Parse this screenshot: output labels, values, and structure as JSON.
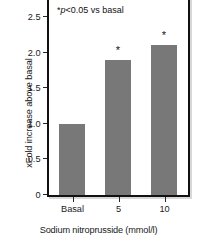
{
  "chart_data": {
    "type": "bar",
    "title": "",
    "categories": [
      "Basal",
      "5",
      "10"
    ],
    "values": [
      1.0,
      1.9,
      2.1
    ],
    "significance_markers": [
      "",
      "*",
      "*"
    ],
    "xlabel": "Sodium nitroprusside (mmol/l)",
    "ylabel": "xFold increase above basal",
    "ylim": [
      0,
      2.75
    ],
    "yticks": [
      "0",
      "0.5",
      "1.0",
      "1.5",
      "2.0",
      "2.5"
    ],
    "ytick_values": [
      0,
      0.5,
      1.0,
      1.5,
      2.0,
      2.5
    ],
    "annotation_prefix": "*",
    "annotation_italic": "p",
    "annotation_rest": "<0.05 vs basal",
    "annotation_full": "*p<0.05 vs basal",
    "grid": false,
    "legend": "none",
    "bar_color": "#787878",
    "frame_color": "#111111",
    "background_color": "#ffffff"
  }
}
